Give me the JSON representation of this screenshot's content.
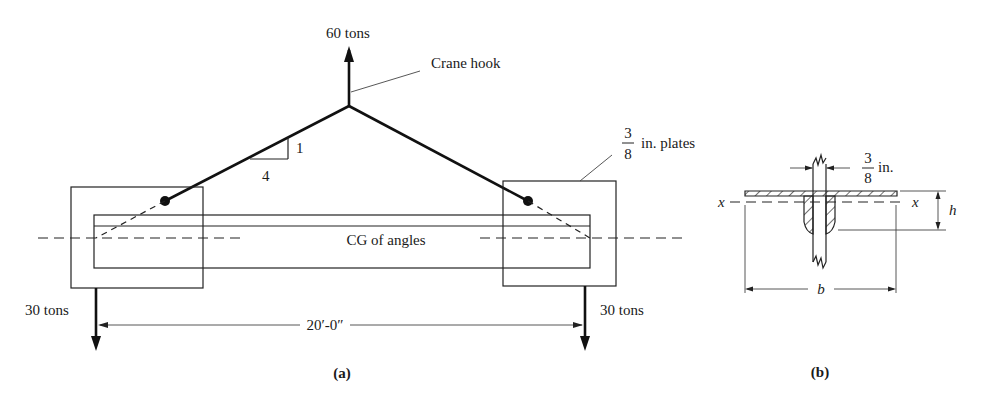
{
  "figure_a": {
    "caption": "(a)",
    "labels": {
      "hook_force": "60 tons",
      "crane_hook": "Crane hook",
      "slope_rise": "1",
      "slope_run": "4",
      "plates_num": "3",
      "plates_den": "8",
      "plates_text": "in. plates",
      "cg": "CG of angles",
      "left_reaction": "30 tons",
      "right_reaction": "30 tons",
      "span": "20′-0″"
    }
  },
  "figure_b": {
    "caption": "(b)",
    "labels": {
      "thickness_num": "3",
      "thickness_den": "8",
      "thickness_unit": "in.",
      "axis_left": "x",
      "axis_right": "x",
      "height": "h",
      "width": "b"
    }
  },
  "colors": {
    "ink": "#111111",
    "background": "#ffffff"
  }
}
